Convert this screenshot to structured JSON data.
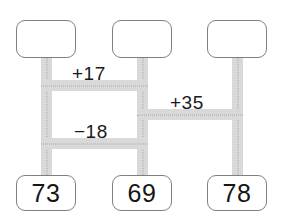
{
  "diagram": {
    "type": "number-ladder",
    "top_nodes": [
      {
        "id": "top-left",
        "value": "",
        "x": 16,
        "y": 20,
        "w": 60,
        "h": 38
      },
      {
        "id": "top-middle",
        "value": "",
        "x": 112,
        "y": 20,
        "w": 60,
        "h": 38
      },
      {
        "id": "top-right",
        "value": "",
        "x": 207,
        "y": 20,
        "w": 60,
        "h": 38
      }
    ],
    "bottom_nodes": [
      {
        "id": "bottom-left",
        "value": "73",
        "x": 16,
        "y": 175,
        "w": 60,
        "h": 36
      },
      {
        "id": "bottom-middle",
        "value": "69",
        "x": 112,
        "y": 175,
        "w": 60,
        "h": 36
      },
      {
        "id": "bottom-right",
        "value": "78",
        "x": 207,
        "y": 175,
        "w": 36,
        "h": 36
      }
    ],
    "edge_labels": [
      {
        "id": "label-plus-17",
        "text": "+17",
        "x": 72,
        "y": 64
      },
      {
        "id": "label-plus-35",
        "text": "+35",
        "x": 170,
        "y": 93
      },
      {
        "id": "label-minus-18",
        "text": "−18",
        "x": 74,
        "y": 122
      }
    ],
    "colors": {
      "box_border": "#808080",
      "box_fill": "#ffffff",
      "connector_band": "#d9d9d9",
      "connector_dots": "#a8a8a8",
      "text": "#161616",
      "background": "#ffffff"
    }
  }
}
